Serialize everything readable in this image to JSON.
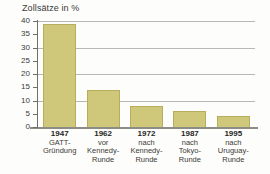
{
  "chart_data": {
    "type": "bar",
    "title": "Zollsätze in %",
    "xlabel": "",
    "ylabel": "",
    "ylim": [
      0,
      40
    ],
    "ytick_values": [
      0,
      5,
      10,
      15,
      20,
      25,
      30,
      35,
      40
    ],
    "ytick_labels": [
      "0",
      "5",
      "10",
      "15",
      "20",
      "25",
      "30",
      "35",
      "40"
    ],
    "gridlines_at": [
      10,
      20,
      30,
      40
    ],
    "grid": true,
    "legend": "none",
    "bar_color": "#cfc87a",
    "bar_edge_color": "#b6ae5c",
    "axis_color": "#6f6f6a",
    "grid_color": "#b9b9b4",
    "categories": [
      "1947",
      "1962",
      "1972",
      "1987",
      "1995"
    ],
    "category_sublabels": [
      [
        "GATT-",
        "Gründung"
      ],
      [
        "vor",
        "Kennedy-",
        "Runde"
      ],
      [
        "nach",
        "Kennedy-",
        "Runde"
      ],
      [
        "nach",
        "Tokyo-",
        "Runde"
      ],
      [
        "nach",
        "Uruguay-",
        "Runde"
      ]
    ],
    "values": [
      39,
      14,
      8,
      6,
      4
    ]
  }
}
